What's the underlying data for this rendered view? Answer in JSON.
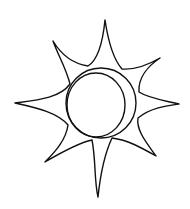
{
  "image": {
    "subject": "Hand-drawn sun sketch with eight pointed rays and a crescent-shaded central disc",
    "style": "black ink line drawing on white background",
    "colors": {
      "background": "#ffffff",
      "ink": "#111111"
    },
    "elements": {
      "rays_count": 8,
      "center_disc": "circle",
      "inner_crescent": "offset inner circle forming crescent shadow on right side"
    }
  }
}
